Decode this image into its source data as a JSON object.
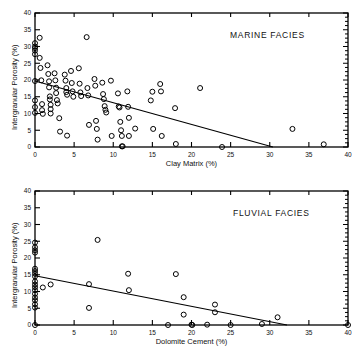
{
  "figure": {
    "background": "#ffffff",
    "ink": "#000000",
    "marker_style": "open-circle"
  },
  "chart_data": [
    {
      "type": "scatter",
      "title": "MARINE FACIES",
      "xlabel": "Clay Matrix (%)",
      "ylabel": "Intergranular Porosity (%)",
      "xlim": [
        0,
        40
      ],
      "ylim": [
        0,
        40
      ],
      "xticks": [
        0,
        5,
        10,
        15,
        20,
        25,
        30,
        35,
        40
      ],
      "yticks": [
        0,
        5,
        10,
        15,
        20,
        25,
        30,
        35,
        40
      ],
      "xticklabels": [
        "0",
        "5",
        "10",
        "15",
        "20",
        "25",
        "30",
        "35",
        "40"
      ],
      "yticklabels": [
        "0",
        "5",
        "10",
        "15",
        "20",
        "25",
        "30",
        "35",
        "40"
      ],
      "grid": false,
      "legend": false,
      "minor_ticks_right_axis": true,
      "marker": "open-circle",
      "points": [
        [
          0.0,
          31.0
        ],
        [
          0.0,
          30.0
        ],
        [
          0.0,
          28.8
        ],
        [
          0.0,
          27.7
        ],
        [
          0.0,
          29.5
        ],
        [
          0.0,
          19.7
        ],
        [
          0.0,
          13.9
        ],
        [
          0.0,
          11.9
        ],
        [
          0.0,
          10.2
        ],
        [
          0.6,
          32.6
        ],
        [
          0.6,
          26.6
        ],
        [
          0.7,
          23.6
        ],
        [
          0.8,
          19.9
        ],
        [
          0.9,
          12.8
        ],
        [
          0.9,
          11.0
        ],
        [
          1.0,
          9.9
        ],
        [
          1.6,
          24.4
        ],
        [
          1.7,
          21.8
        ],
        [
          1.8,
          19.6
        ],
        [
          1.8,
          17.8
        ],
        [
          1.9,
          15.1
        ],
        [
          1.9,
          14.2
        ],
        [
          2.0,
          12.6
        ],
        [
          2.0,
          11.3
        ],
        [
          2.0,
          10.0
        ],
        [
          2.5,
          22.0
        ],
        [
          2.6,
          19.9
        ],
        [
          2.7,
          17.7
        ],
        [
          2.7,
          16.1
        ],
        [
          2.8,
          14.0
        ],
        [
          2.9,
          13.0
        ],
        [
          3.1,
          8.6
        ],
        [
          3.2,
          4.6
        ],
        [
          3.8,
          21.6
        ],
        [
          3.9,
          19.8
        ],
        [
          4.0,
          17.6
        ],
        [
          4.0,
          16.4
        ],
        [
          4.1,
          15.6
        ],
        [
          4.1,
          3.4
        ],
        [
          4.6,
          22.7
        ],
        [
          4.7,
          19.1
        ],
        [
          4.8,
          16.6
        ],
        [
          4.9,
          15.0
        ],
        [
          5.6,
          23.5
        ],
        [
          5.7,
          18.9
        ],
        [
          5.8,
          16.3
        ],
        [
          5.9,
          15.2
        ],
        [
          6.6,
          32.8
        ],
        [
          6.7,
          17.6
        ],
        [
          6.8,
          15.4
        ],
        [
          6.9,
          6.6
        ],
        [
          7.6,
          20.3
        ],
        [
          7.7,
          18.3
        ],
        [
          7.8,
          7.8
        ],
        [
          7.9,
          5.4
        ],
        [
          8.0,
          2.2
        ],
        [
          8.6,
          19.2
        ],
        [
          8.7,
          15.8
        ],
        [
          8.8,
          14.3
        ],
        [
          8.9,
          12.2
        ],
        [
          9.0,
          11.1
        ],
        [
          9.1,
          10.3
        ],
        [
          9.7,
          19.8
        ],
        [
          9.8,
          3.3
        ],
        [
          10.6,
          16.0
        ],
        [
          10.7,
          12.1
        ],
        [
          10.8,
          11.8
        ],
        [
          10.9,
          7.5
        ],
        [
          11.0,
          5.0
        ],
        [
          11.1,
          3.3
        ],
        [
          11.1,
          0.2
        ],
        [
          11.2,
          0.2
        ],
        [
          11.8,
          16.6
        ],
        [
          11.9,
          12.0
        ],
        [
          12.0,
          8.7
        ],
        [
          12.0,
          3.3
        ],
        [
          12.8,
          5.5
        ],
        [
          14.8,
          13.9
        ],
        [
          15.0,
          16.5
        ],
        [
          15.1,
          5.4
        ],
        [
          16.0,
          18.8
        ],
        [
          16.1,
          16.6
        ],
        [
          16.2,
          3.3
        ],
        [
          17.9,
          11.6
        ],
        [
          18.0,
          0.9
        ],
        [
          21.1,
          17.6
        ],
        [
          23.9,
          0.0
        ],
        [
          32.9,
          5.4
        ],
        [
          36.9,
          0.8
        ]
      ],
      "regression_line": {
        "x_start": 0.0,
        "y_start": 19.7,
        "x_end": 30.4,
        "y_end": 0.0,
        "style": "solid"
      }
    },
    {
      "type": "scatter",
      "title": "FLUVIAL FACIES",
      "xlabel": "Dolomite Cement (%)",
      "ylabel": "Intergranular Porosity (%)",
      "xlim": [
        0,
        40
      ],
      "ylim": [
        0,
        40
      ],
      "xticks": [
        0,
        5,
        10,
        15,
        20,
        25,
        30,
        35,
        40
      ],
      "yticks": [
        0,
        5,
        10,
        15,
        20,
        25,
        30,
        35,
        40
      ],
      "xticklabels": [
        "0",
        "5",
        "10",
        "15",
        "20",
        "25",
        "30",
        "35",
        "40"
      ],
      "yticklabels": [
        "0",
        "5",
        "10",
        "15",
        "20",
        "25",
        "30",
        "35",
        "40"
      ],
      "grid": false,
      "legend": false,
      "minor_ticks_right_axis": true,
      "marker": "open-circle",
      "points": [
        [
          0.0,
          24.6
        ],
        [
          0.0,
          23.2
        ],
        [
          0.0,
          22.3
        ],
        [
          0.0,
          21.6
        ],
        [
          0.0,
          16.8
        ],
        [
          0.0,
          16.1
        ],
        [
          0.0,
          15.3
        ],
        [
          0.0,
          14.5
        ],
        [
          0.0,
          13.0
        ],
        [
          0.0,
          12.1
        ],
        [
          0.0,
          11.3
        ],
        [
          0.0,
          10.4
        ],
        [
          0.0,
          9.3
        ],
        [
          0.0,
          8.2
        ],
        [
          0.0,
          7.4
        ],
        [
          0.0,
          6.2
        ],
        [
          0.0,
          5.2
        ],
        [
          0.0,
          0.0
        ],
        [
          1.0,
          11.2
        ],
        [
          2.0,
          12.1
        ],
        [
          6.9,
          12.2
        ],
        [
          6.9,
          5.1
        ],
        [
          8.0,
          25.4
        ],
        [
          11.9,
          15.3
        ],
        [
          12.0,
          10.4
        ],
        [
          17.0,
          0.0
        ],
        [
          18.0,
          15.2
        ],
        [
          19.0,
          8.3
        ],
        [
          19.0,
          3.1
        ],
        [
          20.0,
          0.1
        ],
        [
          20.1,
          0.0
        ],
        [
          22.0,
          0.1
        ],
        [
          23.0,
          6.1
        ],
        [
          23.0,
          3.8
        ],
        [
          25.0,
          0.0
        ],
        [
          29.0,
          0.3
        ],
        [
          31.0,
          2.3
        ],
        [
          40.0,
          0.0
        ]
      ],
      "regression_line": {
        "x_start": 0.0,
        "y_start": 14.7,
        "x_end": 32.2,
        "y_end": 0.0,
        "style": "solid"
      }
    }
  ]
}
